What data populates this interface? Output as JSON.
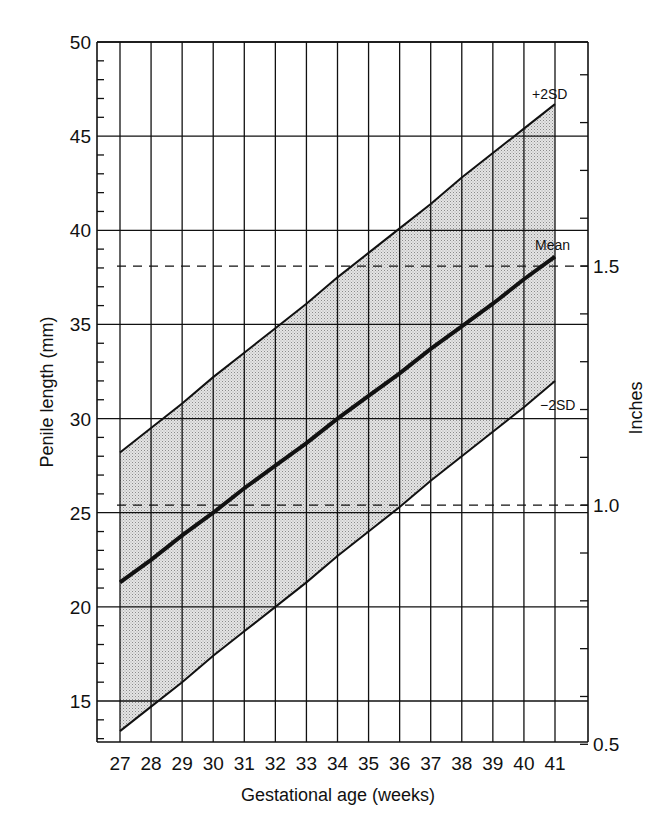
{
  "chart_data": {
    "type": "line",
    "title": "",
    "xlabel": "Gestational age (weeks)",
    "ylabel": "Penile length (mm)",
    "y2label": "Inches",
    "x": [
      27,
      28,
      29,
      30,
      31,
      32,
      33,
      34,
      35,
      36,
      37,
      38,
      39,
      40,
      41
    ],
    "xlim": [
      26.3,
      42.1
    ],
    "ylim": [
      12.8,
      50
    ],
    "yticks": [
      15,
      20,
      25,
      30,
      35,
      40,
      45,
      50
    ],
    "y_minor_tick_step": 1,
    "y2ticks": [
      {
        "label": "0.5",
        "mm": 12.7
      },
      {
        "label": "1.0",
        "mm": 25.4
      },
      {
        "label": "1.5",
        "mm": 38.1
      }
    ],
    "grid": true,
    "series": [
      {
        "name": "+2SD",
        "style": "thin-solid",
        "values": [
          28.2,
          29.5,
          30.8,
          32.2,
          33.5,
          34.8,
          36.1,
          37.5,
          38.8,
          40.1,
          41.4,
          42.8,
          44.1,
          45.4,
          46.7
        ]
      },
      {
        "name": "Mean",
        "style": "thick-solid",
        "values": [
          21.3,
          22.5,
          23.8,
          25.0,
          26.3,
          27.5,
          28.7,
          30.0,
          31.2,
          32.4,
          33.7,
          34.9,
          36.1,
          37.4,
          38.6
        ]
      },
      {
        "name": "-2SD",
        "style": "thin-solid",
        "values": [
          13.4,
          14.7,
          16.0,
          17.4,
          18.7,
          20.0,
          21.3,
          22.7,
          24.0,
          25.3,
          26.7,
          28.0,
          29.3,
          30.6,
          32.0
        ]
      }
    ],
    "shaded_band": {
      "from": "-2SD",
      "to": "+2SD",
      "pattern": "stipple"
    },
    "reference_lines": [
      {
        "mm": 38.1,
        "label": "1.5 in",
        "style": "dashed"
      },
      {
        "mm": 25.4,
        "label": "1.0 in",
        "style": "dashed"
      }
    ],
    "annotations": [
      "+2SD",
      "Mean",
      "−2SD"
    ],
    "legend": "none (inline labels)"
  },
  "labels": {
    "xlabel": "Gestational age (weeks)",
    "ylabel": "Penile length (mm)",
    "y2label": "Inches",
    "plus2sd": "+2SD",
    "mean": "Mean",
    "minus2sd": "−2SD"
  },
  "colors": {
    "ink": "#111111",
    "band_fill": "#d6d6d6",
    "background": "#ffffff"
  }
}
